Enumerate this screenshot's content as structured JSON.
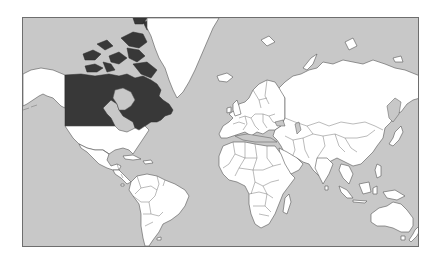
{
  "map": {
    "title": "World map with Canada highlighted",
    "highlighted_country": "Canada",
    "colors": {
      "ocean": "#c8c8c8",
      "land": "#ffffff",
      "highlight": "#383838",
      "border": "#555555",
      "frame": "#6e6e6e"
    },
    "projection": "Mercator"
  }
}
